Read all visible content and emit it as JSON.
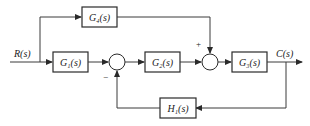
{
  "diagram": {
    "type": "control-system-block-diagram",
    "input": {
      "label": "R(s)"
    },
    "output": {
      "label": "C(s)"
    },
    "blocks": [
      {
        "id": "G1",
        "label": "G1(s)",
        "display": "G₁(s)"
      },
      {
        "id": "G2",
        "label": "G2(s)",
        "display": "G₂(s)"
      },
      {
        "id": "G3",
        "label": "G3(s)",
        "display": "G₃(s)"
      },
      {
        "id": "G4",
        "label": "G4(s)",
        "display": "G₄(s)"
      },
      {
        "id": "H1",
        "label": "H1(s)",
        "display": "H₁(s)"
      }
    ],
    "summing_junctions": [
      {
        "id": "S1",
        "signs": {
          "left": "",
          "bottom": "−"
        }
      },
      {
        "id": "S2",
        "signs": {
          "left": "",
          "top": "+"
        }
      }
    ],
    "connections": [
      {
        "from": "R(s)",
        "to": "G1"
      },
      {
        "from": "R(s)",
        "to": "G4"
      },
      {
        "from": "G1",
        "to": "S1"
      },
      {
        "from": "S1",
        "to": "G2"
      },
      {
        "from": "G2",
        "to": "S2"
      },
      {
        "from": "G4",
        "to": "S2"
      },
      {
        "from": "S2",
        "to": "G3"
      },
      {
        "from": "G3",
        "to": "C(s)"
      },
      {
        "from": "C(s)",
        "to": "H1"
      },
      {
        "from": "H1",
        "to": "S1"
      }
    ],
    "colors": {
      "line": "#3a3a3a",
      "background": "#ffffff"
    }
  }
}
